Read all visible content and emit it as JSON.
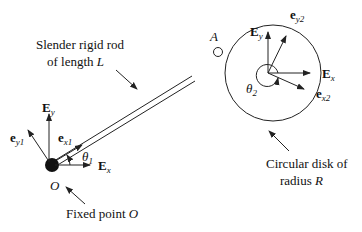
{
  "diagram": {
    "labels": {
      "rod_line1": "Slender rigid rod",
      "rod_line2_prefix": "of length ",
      "rod_length_symbol": "L",
      "point_A": "A",
      "point_O": "O",
      "fixed_point_prefix": "Fixed point ",
      "fixed_point_symbol": "O",
      "disk_line1": "Circular disk of",
      "disk_line2_prefix": "radius ",
      "disk_radius_symbol": "R"
    },
    "vectors_at_O": {
      "Ey": {
        "base": "E",
        "sub": "y"
      },
      "Ex": {
        "base": "E",
        "sub": "x"
      },
      "ex1": {
        "base": "e",
        "sub": "x1"
      },
      "ey1": {
        "base": "e",
        "sub": "y1"
      },
      "theta1": {
        "base": "θ",
        "sub": "1"
      }
    },
    "vectors_at_disk": {
      "Ey": {
        "base": "E",
        "sub": "y"
      },
      "Ex": {
        "base": "E",
        "sub": "x"
      },
      "ex2": {
        "base": "e",
        "sub": "x2"
      },
      "ey2": {
        "base": "e",
        "sub": "y2"
      },
      "theta2": {
        "base": "θ",
        "sub": "2"
      }
    },
    "colors": {
      "stroke": "#222222",
      "background": "#ffffff"
    }
  }
}
